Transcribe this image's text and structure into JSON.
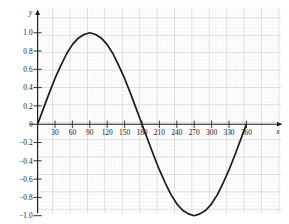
{
  "chart_data": {
    "type": "line",
    "title": "",
    "subtitle": "",
    "xlabel": "x",
    "ylabel": "y",
    "xlim": [
      0,
      370
    ],
    "ylim": [
      -1.08,
      1.08
    ],
    "grid": true,
    "grid_minor": true,
    "legend": "none",
    "annotations": [],
    "series": [
      {
        "name": "sine curve",
        "color": "#1a1a1a",
        "x": [
          0,
          10,
          20,
          30,
          40,
          50,
          60,
          70,
          80,
          90,
          100,
          110,
          120,
          130,
          140,
          150,
          160,
          170,
          180,
          190,
          200,
          210,
          220,
          230,
          240,
          250,
          260,
          270,
          280,
          290,
          300,
          310,
          320,
          330,
          340,
          350,
          360
        ],
        "values": [
          0.0,
          0.17,
          0.34,
          0.5,
          0.64,
          0.77,
          0.87,
          0.94,
          0.98,
          1.0,
          0.98,
          0.94,
          0.87,
          0.77,
          0.64,
          0.5,
          0.34,
          0.17,
          0.0,
          -0.17,
          -0.34,
          -0.5,
          -0.64,
          -0.77,
          -0.87,
          -0.94,
          -0.98,
          -1.0,
          -0.98,
          -0.94,
          -0.87,
          -0.77,
          -0.64,
          -0.5,
          -0.34,
          -0.17,
          0.0
        ]
      }
    ],
    "x_ticks": [
      {
        "value": 30,
        "label": "30"
      },
      {
        "value": 60,
        "label": "60"
      },
      {
        "value": 90,
        "label": "90"
      },
      {
        "value": 120,
        "label": "120"
      },
      {
        "value": 150,
        "label": "150"
      },
      {
        "value": 180,
        "label": "180"
      },
      {
        "value": 210,
        "label": "210"
      },
      {
        "value": 240,
        "label": "240"
      },
      {
        "value": 270,
        "label": "270"
      },
      {
        "value": 300,
        "label": "300"
      },
      {
        "value": 330,
        "label": "330"
      },
      {
        "value": 360,
        "label": "360"
      }
    ],
    "y_ticks": [
      {
        "value": 1.0,
        "label": "1.0"
      },
      {
        "value": 0.8,
        "label": "0.8"
      },
      {
        "value": 0.6,
        "label": "0.6"
      },
      {
        "value": 0.4,
        "label": "0.4"
      },
      {
        "value": 0.2,
        "label": "0.2"
      },
      {
        "value": 0.0,
        "label": "0"
      },
      {
        "value": -0.2,
        "label": "−0.2"
      },
      {
        "value": -0.4,
        "label": "−0.4"
      },
      {
        "value": -0.6,
        "label": "−0.6"
      },
      {
        "value": -0.8,
        "label": "−0.8"
      },
      {
        "value": -1.0,
        "label": "−1.0"
      }
    ],
    "colors": {
      "curve": "#1a1a1a",
      "axis": "#1a1a1a",
      "grid_major": "#b9b9b9",
      "grid_minor": "#e9e9e9",
      "background": "#ffffff"
    }
  }
}
